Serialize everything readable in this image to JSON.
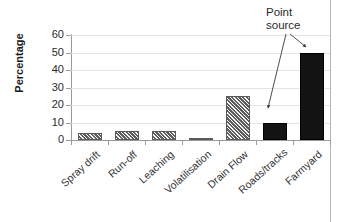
{
  "chart_data": {
    "type": "bar",
    "title": "",
    "xlabel": "",
    "ylabel": "Percentage",
    "categories": [
      "Spray drift",
      "Run-off",
      "Leaching",
      "Volatilisation",
      "Drain Flow",
      "Roads/tracks",
      "Farmyard"
    ],
    "values": [
      4,
      5,
      5,
      1,
      25,
      10,
      50
    ],
    "ylim": [
      0,
      60
    ],
    "ytick_labels": [
      "0",
      "10",
      "20",
      "30",
      "40",
      "50",
      "60"
    ],
    "ytick_values": [
      0,
      10,
      20,
      30,
      40,
      50,
      60
    ],
    "grid": true,
    "legend": "none",
    "bar_styles": [
      "hatched",
      "hatched",
      "hatched",
      "hatched",
      "hatched",
      "solid",
      "solid"
    ],
    "annotations": [
      {
        "text": "Point source",
        "line1": "Point",
        "line2": "source",
        "targets": [
          "Roads/tracks",
          "Farmyard"
        ]
      }
    ],
    "colors": {
      "hatched_fill": "#a5a5a5",
      "solid_fill": "#131313",
      "bar_edge": "#5a5a5a",
      "gridline": "#e4e4e4",
      "axis": "#9a9a9a",
      "text": "#2b2b2b"
    }
  },
  "axis": {
    "y_title": "Percentage"
  }
}
